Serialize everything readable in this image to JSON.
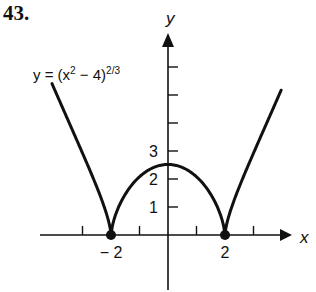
{
  "problem_number": "43.",
  "equation": {
    "lhs": "y = (x",
    "sup1": "2",
    "mid": " − 4)",
    "sup2": "2/3"
  },
  "chart_data": {
    "type": "line",
    "title": "",
    "function": "y = (x^2 - 4)^(2/3)",
    "xlabel": "x",
    "ylabel": "y",
    "x_ticks": [
      -3,
      -2,
      -1,
      1,
      2,
      3
    ],
    "x_tick_labels": [
      {
        "value": -2,
        "label": "− 2"
      },
      {
        "value": 2,
        "label": "2"
      }
    ],
    "y_ticks": [
      1,
      2,
      3,
      4,
      5,
      6
    ],
    "y_tick_labels": [
      {
        "value": 1,
        "label": "1"
      },
      {
        "value": 2,
        "label": "2"
      },
      {
        "value": 3,
        "label": "3"
      }
    ],
    "xlim": [
      -4.07,
      4.0
    ],
    "ylim": [
      -2,
      7
    ],
    "grid": false,
    "legend": "none",
    "marked_points": [
      {
        "x": -2,
        "y": 0
      },
      {
        "x": 2,
        "y": 0
      }
    ],
    "series": [
      {
        "name": "left branch",
        "x_range": [
          -4.07,
          -2
        ]
      },
      {
        "name": "middle arch",
        "x_range": [
          -2,
          2
        ],
        "peak": {
          "x": 0,
          "y": 2.52
        }
      },
      {
        "name": "right branch",
        "x_range": [
          2,
          3.97
        ]
      }
    ]
  },
  "layout": {
    "origin_px": [
      168,
      235
    ],
    "unit_x_px": 28.5,
    "unit_y_px": 28,
    "curve_color": "#111111"
  }
}
